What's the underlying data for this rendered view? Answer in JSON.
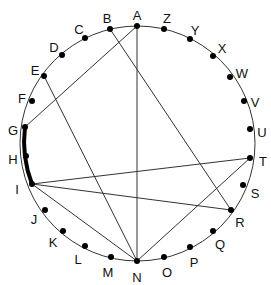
{
  "diagram": {
    "type": "circle-with-chords",
    "circle": {
      "cx": 137.5,
      "cy": 143.5,
      "r": 117.5,
      "stroke": "#333333"
    },
    "points": [
      {
        "id": "A",
        "x": 137,
        "y": 26,
        "lx": 137,
        "ly": 17
      },
      {
        "id": "B",
        "x": 110,
        "y": 29,
        "lx": 107,
        "ly": 20
      },
      {
        "id": "C",
        "x": 85,
        "y": 38,
        "lx": 79,
        "ly": 31
      },
      {
        "id": "D",
        "x": 62,
        "y": 55,
        "lx": 54,
        "ly": 49
      },
      {
        "id": "E",
        "x": 44,
        "y": 76,
        "lx": 35,
        "ly": 72
      },
      {
        "id": "F",
        "x": 32,
        "y": 101,
        "lx": 22,
        "ly": 100
      },
      {
        "id": "G",
        "x": 25,
        "y": 127,
        "lx": 13,
        "ly": 132
      },
      {
        "id": "H",
        "x": 26,
        "y": 156,
        "lx": 13,
        "ly": 161
      },
      {
        "id": "I",
        "x": 32,
        "y": 184,
        "lx": 17,
        "ly": 191
      },
      {
        "id": "J",
        "x": 45,
        "y": 210,
        "lx": 34,
        "ly": 221
      },
      {
        "id": "K",
        "x": 63,
        "y": 231,
        "lx": 53,
        "ly": 244
      },
      {
        "id": "L",
        "x": 85,
        "y": 246,
        "lx": 78,
        "ly": 261
      },
      {
        "id": "M",
        "x": 111,
        "y": 257,
        "lx": 108,
        "ly": 274
      },
      {
        "id": "N",
        "x": 137,
        "y": 261,
        "lx": 137,
        "ly": 279
      },
      {
        "id": "O",
        "x": 164,
        "y": 257,
        "lx": 167,
        "ly": 274
      },
      {
        "id": "P",
        "x": 190,
        "y": 247,
        "lx": 194,
        "ly": 264
      },
      {
        "id": "Q",
        "x": 213,
        "y": 231,
        "lx": 220,
        "ly": 246
      },
      {
        "id": "R",
        "x": 231,
        "y": 210,
        "lx": 240,
        "ly": 224
      },
      {
        "id": "S",
        "x": 243,
        "y": 185,
        "lx": 255,
        "ly": 195
      },
      {
        "id": "T",
        "x": 250,
        "y": 158,
        "lx": 263,
        "ly": 163
      },
      {
        "id": "U",
        "x": 250,
        "y": 129,
        "lx": 262,
        "ly": 134
      },
      {
        "id": "V",
        "x": 244,
        "y": 101,
        "lx": 255,
        "ly": 104
      },
      {
        "id": "W",
        "x": 230,
        "y": 77,
        "lx": 242,
        "ly": 75
      },
      {
        "id": "X",
        "x": 213,
        "y": 56,
        "lx": 222,
        "ly": 50
      },
      {
        "id": "Y",
        "x": 190,
        "y": 39,
        "lx": 195,
        "ly": 32
      },
      {
        "id": "Z",
        "x": 164,
        "y": 29,
        "lx": 167,
        "ly": 20
      }
    ],
    "chords": [
      [
        "A",
        "N"
      ],
      [
        "A",
        "G"
      ],
      [
        "B",
        "R"
      ],
      [
        "E",
        "N"
      ],
      [
        "I",
        "T"
      ],
      [
        "I",
        "R"
      ],
      [
        "I",
        "N"
      ],
      [
        "T",
        "N"
      ]
    ],
    "highlighted_arc": {
      "from": "G",
      "via": "H",
      "to": "I",
      "stroke_width": 4
    }
  }
}
